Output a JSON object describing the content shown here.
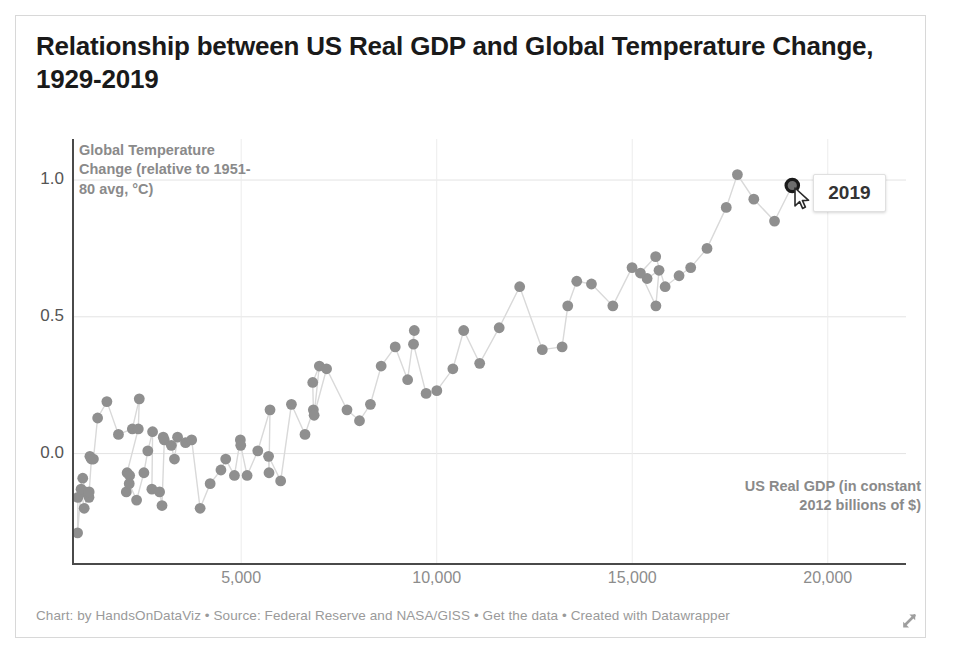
{
  "title": "Relationship between US Real GDP and Global Temperature Change, 1929-2019",
  "footer": {
    "credit": "Chart: by HandsOnDataViz",
    "source": "Source: Federal Reserve and NASA/GISS",
    "data_link": "Get the data",
    "tool": "Created with Datawrapper",
    "separator": " • ",
    "full": "Chart: by HandsOnDataViz • Source: Federal Reserve and NASA/GISS • Get the data • Created with Datawrapper"
  },
  "tooltip": {
    "label": "2019",
    "highlight_color": "#1a1a1a"
  },
  "colors": {
    "dot": "#8f8f8f",
    "connector": "#d9d9d9",
    "grid": "#e3e3e3",
    "axis": "#4a4a4a",
    "axis_label": "#8a8a8a",
    "tick_label": "#8c8c8c",
    "title": "#1a1a1a",
    "footer": "#9a9a9a",
    "frame": "#d8d8d8"
  },
  "chart_data": {
    "type": "scatter",
    "title": "Relationship between US Real GDP and Global Temperature Change, 1929-2019",
    "xlabel": "US Real GDP (in constant 2012 billions of $)",
    "ylabel": "Global Temperature Change (relative to 1951-80 avg, °C)",
    "xlim": [
      700,
      22000
    ],
    "ylim": [
      -0.4,
      1.15
    ],
    "xticks": [
      5000,
      10000,
      15000,
      20000
    ],
    "xtick_labels": [
      "5,000",
      "10,000",
      "15,000",
      "20,000"
    ],
    "yticks": [
      0.0,
      0.5,
      1.0
    ],
    "ytick_labels": [
      "0.0",
      "0.5",
      "1.0"
    ],
    "grid": "horizontal-and-vertical",
    "legend": "none",
    "connected": true,
    "point_label_key": "year",
    "highlighted_point": {
      "year": 2019,
      "x": 19092,
      "y": 0.98
    },
    "series": [
      {
        "name": "Year (1929-2019)",
        "points": [
          {
            "year": 1929,
            "x": 1109,
            "y": -0.16
          },
          {
            "year": 1930,
            "x": 1015,
            "y": -0.14
          },
          {
            "year": 1931,
            "x": 949,
            "y": -0.09
          },
          {
            "year": 1932,
            "x": 826,
            "y": -0.16
          },
          {
            "year": 1933,
            "x": 817,
            "y": -0.29
          },
          {
            "year": 1934,
            "x": 906,
            "y": -0.13
          },
          {
            "year": 1935,
            "x": 986,
            "y": -0.2
          },
          {
            "year": 1936,
            "x": 1113,
            "y": -0.14
          },
          {
            "year": 1937,
            "x": 1171,
            "y": -0.02
          },
          {
            "year": 1938,
            "x": 1132,
            "y": -0.01
          },
          {
            "year": 1939,
            "x": 1222,
            "y": -0.02
          },
          {
            "year": 1940,
            "x": 1330,
            "y": 0.13
          },
          {
            "year": 1941,
            "x": 1566,
            "y": 0.19
          },
          {
            "year": 1942,
            "x": 1862,
            "y": 0.07
          },
          {
            "year": 1943,
            "x": 2217,
            "y": 0.09
          },
          {
            "year": 1944,
            "x": 2395,
            "y": 0.2
          },
          {
            "year": 1945,
            "x": 2370,
            "y": 0.09
          },
          {
            "year": 1946,
            "x": 2084,
            "y": -0.07
          },
          {
            "year": 1947,
            "x": 2063,
            "y": -0.14
          },
          {
            "year": 1948,
            "x": 2149,
            "y": -0.08
          },
          {
            "year": 1949,
            "x": 2138,
            "y": -0.11
          },
          {
            "year": 1950,
            "x": 2326,
            "y": -0.17
          },
          {
            "year": 1951,
            "x": 2513,
            "y": -0.07
          },
          {
            "year": 1952,
            "x": 2613,
            "y": 0.01
          },
          {
            "year": 1953,
            "x": 2735,
            "y": 0.08
          },
          {
            "year": 1954,
            "x": 2717,
            "y": -0.13
          },
          {
            "year": 1955,
            "x": 2914,
            "y": -0.14
          },
          {
            "year": 1956,
            "x": 2976,
            "y": -0.19
          },
          {
            "year": 1957,
            "x": 3034,
            "y": 0.05
          },
          {
            "year": 1958,
            "x": 3007,
            "y": 0.06
          },
          {
            "year": 1959,
            "x": 3214,
            "y": 0.03
          },
          {
            "year": 1960,
            "x": 3294,
            "y": -0.02
          },
          {
            "year": 1961,
            "x": 3374,
            "y": 0.06
          },
          {
            "year": 1962,
            "x": 3578,
            "y": 0.04
          },
          {
            "year": 1963,
            "x": 3734,
            "y": 0.05
          },
          {
            "year": 1964,
            "x": 3951,
            "y": -0.2
          },
          {
            "year": 1965,
            "x": 4207,
            "y": -0.11
          },
          {
            "year": 1966,
            "x": 4483,
            "y": -0.06
          },
          {
            "year": 1967,
            "x": 4605,
            "y": -0.02
          },
          {
            "year": 1968,
            "x": 4828,
            "y": -0.08
          },
          {
            "year": 1969,
            "x": 4979,
            "y": 0.05
          },
          {
            "year": 1970,
            "x": 4989,
            "y": 0.03
          },
          {
            "year": 1971,
            "x": 5152,
            "y": -0.08
          },
          {
            "year": 1972,
            "x": 5425,
            "y": 0.01
          },
          {
            "year": 1973,
            "x": 5738,
            "y": 0.16
          },
          {
            "year": 1974,
            "x": 5712,
            "y": -0.07
          },
          {
            "year": 1975,
            "x": 5701,
            "y": -0.01
          },
          {
            "year": 1976,
            "x": 6010,
            "y": -0.1
          },
          {
            "year": 1977,
            "x": 6285,
            "y": 0.18
          },
          {
            "year": 1978,
            "x": 6632,
            "y": 0.07
          },
          {
            "year": 1979,
            "x": 6846,
            "y": 0.16
          },
          {
            "year": 1980,
            "x": 6830,
            "y": 0.26
          },
          {
            "year": 1981,
            "x": 6999,
            "y": 0.32
          },
          {
            "year": 1982,
            "x": 6866,
            "y": 0.14
          },
          {
            "year": 1983,
            "x": 7184,
            "y": 0.31
          },
          {
            "year": 1984,
            "x": 7706,
            "y": 0.16
          },
          {
            "year": 1985,
            "x": 8026,
            "y": 0.12
          },
          {
            "year": 1986,
            "x": 8305,
            "y": 0.18
          },
          {
            "year": 1987,
            "x": 8580,
            "y": 0.32
          },
          {
            "year": 1988,
            "x": 8939,
            "y": 0.39
          },
          {
            "year": 1989,
            "x": 9257,
            "y": 0.27
          },
          {
            "year": 1990,
            "x": 9427,
            "y": 0.45
          },
          {
            "year": 1991,
            "x": 9407,
            "y": 0.4
          },
          {
            "year": 1992,
            "x": 9730,
            "y": 0.22
          },
          {
            "year": 1993,
            "x": 10003,
            "y": 0.23
          },
          {
            "year": 1994,
            "x": 10413,
            "y": 0.31
          },
          {
            "year": 1995,
            "x": 10690,
            "y": 0.45
          },
          {
            "year": 1996,
            "x": 11099,
            "y": 0.33
          },
          {
            "year": 1997,
            "x": 11598,
            "y": 0.46
          },
          {
            "year": 1998,
            "x": 12122,
            "y": 0.61
          },
          {
            "year": 1999,
            "x": 12700,
            "y": 0.38
          },
          {
            "year": 2000,
            "x": 13207,
            "y": 0.39
          },
          {
            "year": 2001,
            "x": 13351,
            "y": 0.54
          },
          {
            "year": 2002,
            "x": 13581,
            "y": 0.63
          },
          {
            "year": 2003,
            "x": 13957,
            "y": 0.62
          },
          {
            "year": 2004,
            "x": 14504,
            "y": 0.54
          },
          {
            "year": 2005,
            "x": 14995,
            "y": 0.68
          },
          {
            "year": 2006,
            "x": 15380,
            "y": 0.64
          },
          {
            "year": 2007,
            "x": 15685,
            "y": 0.67
          },
          {
            "year": 2008,
            "x": 15605,
            "y": 0.54
          },
          {
            "year": 2009,
            "x": 15209,
            "y": 0.66
          },
          {
            "year": 2010,
            "x": 15599,
            "y": 0.72
          },
          {
            "year": 2011,
            "x": 15841,
            "y": 0.61
          },
          {
            "year": 2012,
            "x": 16197,
            "y": 0.65
          },
          {
            "year": 2013,
            "x": 16495,
            "y": 0.68
          },
          {
            "year": 2014,
            "x": 16912,
            "y": 0.75
          },
          {
            "year": 2015,
            "x": 17404,
            "y": 0.9
          },
          {
            "year": 2016,
            "x": 17689,
            "y": 1.02
          },
          {
            "year": 2017,
            "x": 18108,
            "y": 0.93
          },
          {
            "year": 2018,
            "x": 18638,
            "y": 0.85
          },
          {
            "year": 2019,
            "x": 19092,
            "y": 0.98
          }
        ]
      }
    ]
  }
}
